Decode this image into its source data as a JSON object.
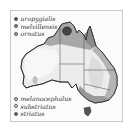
{
  "figure": {
    "type": "distribution-map",
    "region": "Australia"
  },
  "legend": {
    "top": [
      {
        "label": "uropygialis",
        "color": "#5a5a5a"
      },
      {
        "label": "melvillensis",
        "color": "#8e8e8e"
      },
      {
        "label": "ornatus",
        "color": "#b8b8b8"
      }
    ],
    "bottom": [
      {
        "label": "melanocephalus",
        "color": "#d2d2d2"
      },
      {
        "label": "substriatus",
        "color": "#f2f2f2"
      },
      {
        "label": "striatus",
        "color": "#6e6e6e"
      }
    ]
  }
}
